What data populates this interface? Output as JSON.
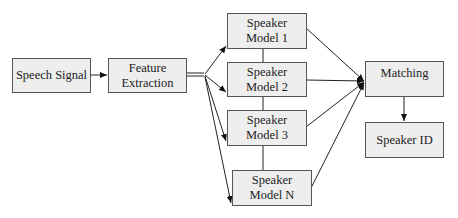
{
  "diagram": {
    "nodes": [
      {
        "id": "speech-signal",
        "label": "Speech Signal"
      },
      {
        "id": "feature-extraction",
        "label": "Feature\nExtraction"
      },
      {
        "id": "speaker-model-1",
        "label": "Speaker\nModel 1"
      },
      {
        "id": "speaker-model-2",
        "label": "Speaker\nModel 2"
      },
      {
        "id": "speaker-model-3",
        "label": "Speaker\nModel 3"
      },
      {
        "id": "speaker-model-n",
        "label": "Speaker\nModel N"
      },
      {
        "id": "matching",
        "label": "Matching"
      },
      {
        "id": "speaker-id",
        "label": "Speaker ID"
      }
    ],
    "edges": [
      {
        "from": "speech-signal",
        "to": "feature-extraction"
      },
      {
        "from": "feature-extraction",
        "to": "speaker-model-1"
      },
      {
        "from": "feature-extraction",
        "to": "speaker-model-2"
      },
      {
        "from": "feature-extraction",
        "to": "speaker-model-3"
      },
      {
        "from": "feature-extraction",
        "to": "speaker-model-n"
      },
      {
        "from": "speaker-model-1",
        "to": "matching"
      },
      {
        "from": "speaker-model-2",
        "to": "matching"
      },
      {
        "from": "speaker-model-3",
        "to": "matching"
      },
      {
        "from": "speaker-model-n",
        "to": "matching"
      },
      {
        "from": "matching",
        "to": "speaker-id"
      }
    ]
  }
}
